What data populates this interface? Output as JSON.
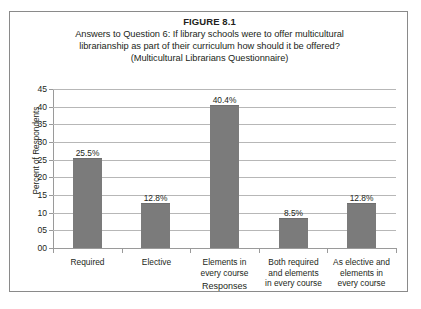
{
  "figure": {
    "number": "FIGURE 8.1",
    "title_lines": [
      "Answers to Question 6: If library schools were to offer multicultural",
      "librarianship as part of their curriculum how should it be offered?",
      "(Multicultural Librarians Questionnaire)"
    ]
  },
  "chart_data": {
    "type": "bar",
    "xlabel": "Responses",
    "ylabel": "Percent of Respondents",
    "ylim": [
      0,
      45
    ],
    "ytick_labels": [
      "00",
      "05",
      "10",
      "15",
      "20",
      "25",
      "30",
      "35",
      "40",
      "45"
    ],
    "ytick_values": [
      0,
      5,
      10,
      15,
      20,
      25,
      30,
      35,
      40,
      45
    ],
    "grid": true,
    "legend": "none",
    "bar_color": "#7b7b7b",
    "categories": [
      "Required",
      "Elective",
      "Elements in every course",
      "Both required and elements in every course",
      "As elective and elements in every course"
    ],
    "category_lines": [
      [
        "Required"
      ],
      [
        "Elective"
      ],
      [
        "Elements in",
        "every course"
      ],
      [
        "Both required",
        "and elements",
        "in every course"
      ],
      [
        "As elective and",
        "elements in",
        "every course"
      ]
    ],
    "values": [
      25.5,
      12.8,
      40.4,
      8.5,
      12.8
    ],
    "data_labels": [
      "25.5%",
      "12.8%",
      "40.4%",
      "8.5%",
      "12.8%"
    ]
  }
}
